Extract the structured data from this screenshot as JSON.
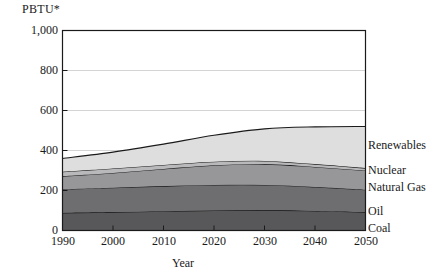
{
  "chart_data": {
    "type": "area",
    "stacked": true,
    "title": "",
    "xlabel": "Year",
    "ylabel": "PBTU*",
    "x": [
      1990,
      2000,
      2010,
      2020,
      2030,
      2040,
      2050
    ],
    "xlim": [
      1990,
      2050
    ],
    "ylim": [
      0,
      1000
    ],
    "yticks": [
      0,
      200,
      400,
      600,
      800,
      1000
    ],
    "ytick_labels": [
      "0",
      "200",
      "400",
      "600",
      "800",
      "1,000"
    ],
    "xtick_labels": [
      "1990",
      "2000",
      "2010",
      "2020",
      "2030",
      "2040",
      "2050"
    ],
    "grid": "horizontal",
    "legend_position": "right-inline",
    "series": [
      {
        "name": "Coal",
        "color": "#58585a",
        "values": [
          88,
          92,
          96,
          100,
          102,
          98,
          92
        ]
      },
      {
        "name": "Oil",
        "color": "#6e6e70",
        "values": [
          118,
          122,
          126,
          128,
          126,
          120,
          112
        ]
      },
      {
        "name": "Natural Gas",
        "color": "#97979a",
        "values": [
          66,
          74,
          86,
          98,
          104,
          100,
          96
        ]
      },
      {
        "name": "Nuclear",
        "color": "#b9b9bb",
        "values": [
          22,
          22,
          20,
          18,
          16,
          14,
          12
        ]
      },
      {
        "name": "Renewables",
        "color": "#dedede",
        "values": [
          66,
          82,
          104,
          132,
          160,
          186,
          208
        ]
      }
    ],
    "series_totals": [
      360,
      392,
      432,
      476,
      508,
      518,
      520
    ],
    "note": "PBTU*"
  },
  "axes": {
    "y_title": "PBTU*",
    "x_title": "Year"
  },
  "labels": {
    "renewables": "Renewables",
    "nuclear": "Nuclear",
    "natural_gas": "Natural Gas",
    "oil": "Oil",
    "coal": "Coal"
  }
}
